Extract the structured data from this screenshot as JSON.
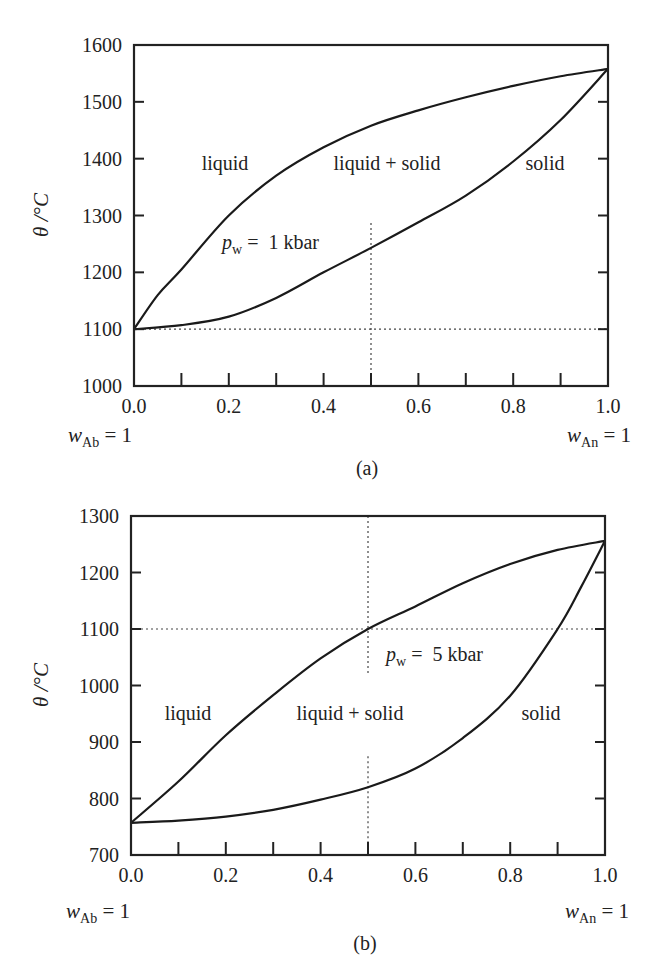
{
  "chart_data": [
    {
      "type": "line",
      "panel_label": "(a)",
      "ylabel": "θ /°C",
      "xlabel_left": {
        "var": "w",
        "sub": "Ab",
        "rest": " = 1"
      },
      "xlabel_right": {
        "var": "w",
        "sub": "An",
        "rest": " = 1"
      },
      "xlim": [
        0.0,
        1.0
      ],
      "ylim": [
        1000,
        1600
      ],
      "xticks": [
        "0.0",
        "0.2",
        "0.4",
        "0.6",
        "0.8",
        "1.0"
      ],
      "yticks": [
        "1000",
        "1100",
        "1200",
        "1300",
        "1400",
        "1500",
        "1600"
      ],
      "pressure_label": {
        "var": "p",
        "sub": "w",
        "rest": " =  1 kbar"
      },
      "regions": [
        "liquid",
        "liquid + solid",
        "solid"
      ],
      "series": [
        {
          "name": "liquidus",
          "x": [
            0.0,
            0.05,
            0.1,
            0.2,
            0.3,
            0.4,
            0.5,
            0.6,
            0.7,
            0.8,
            0.9,
            1.0
          ],
          "y": [
            1100,
            1160,
            1205,
            1300,
            1370,
            1420,
            1458,
            1485,
            1508,
            1528,
            1545,
            1558
          ]
        },
        {
          "name": "solidus",
          "x": [
            0.0,
            0.1,
            0.2,
            0.3,
            0.4,
            0.5,
            0.6,
            0.7,
            0.8,
            0.9,
            1.0
          ],
          "y": [
            1100,
            1107,
            1122,
            1155,
            1200,
            1243,
            1288,
            1335,
            1395,
            1468,
            1558
          ]
        }
      ],
      "guides": {
        "x": 0.5,
        "y": 1100
      }
    },
    {
      "type": "line",
      "panel_label": "(b)",
      "ylabel": "θ /°C",
      "xlabel_left": {
        "var": "w",
        "sub": "Ab",
        "rest": " = 1"
      },
      "xlabel_right": {
        "var": "w",
        "sub": "An",
        "rest": " = 1"
      },
      "xlim": [
        0.0,
        1.0
      ],
      "ylim": [
        700,
        1300
      ],
      "xticks": [
        "0.0",
        "0.2",
        "0.4",
        "0.6",
        "0.8",
        "1.0"
      ],
      "yticks": [
        "700",
        "800",
        "900",
        "1000",
        "1100",
        "1200",
        "1300"
      ],
      "pressure_label": {
        "var": "p",
        "sub": "w",
        "rest": " =  5 kbar"
      },
      "regions": [
        "liquid",
        "liquid + solid",
        "solid"
      ],
      "series": [
        {
          "name": "liquidus",
          "x": [
            0.0,
            0.1,
            0.2,
            0.3,
            0.4,
            0.5,
            0.6,
            0.7,
            0.8,
            0.9,
            1.0
          ],
          "y": [
            757,
            830,
            912,
            983,
            1048,
            1100,
            1140,
            1181,
            1215,
            1240,
            1256
          ]
        },
        {
          "name": "solidus",
          "x": [
            0.0,
            0.1,
            0.2,
            0.3,
            0.4,
            0.5,
            0.6,
            0.7,
            0.8,
            0.9,
            0.95,
            1.0
          ],
          "y": [
            757,
            761,
            768,
            780,
            798,
            820,
            853,
            907,
            982,
            1100,
            1175,
            1256
          ]
        }
      ],
      "guides": {
        "x": 0.5,
        "y": 1100
      }
    }
  ]
}
